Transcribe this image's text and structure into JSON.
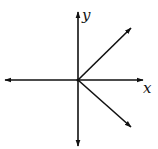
{
  "diagram": {
    "type": "coordinate-axes-with-vectors",
    "colors": {
      "stroke": "#111111",
      "background": "#ffffff"
    },
    "origin": {
      "x": 78,
      "y": 80
    },
    "axes": {
      "x": {
        "label": "x",
        "from": [
          5,
          80
        ],
        "to": [
          143,
          80
        ],
        "arrow_both_ends": true
      },
      "y": {
        "label": "y",
        "from": [
          78,
          146
        ],
        "to": [
          78,
          12
        ],
        "arrow_both_ends": true
      }
    },
    "vectors": [
      {
        "name": "upper-right-vector",
        "from": [
          78,
          80
        ],
        "to": [
          131,
          28
        ]
      },
      {
        "name": "lower-right-vector",
        "from": [
          78,
          80
        ],
        "to": [
          131,
          127
        ]
      }
    ],
    "labels": {
      "x_axis": "x",
      "y_axis": "y"
    }
  }
}
